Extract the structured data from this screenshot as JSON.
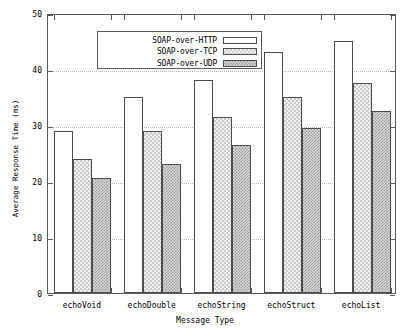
{
  "chart_data": {
    "type": "bar",
    "title": "",
    "xlabel": "Message Type",
    "ylabel": "Average Response Time (ms)",
    "ylim": [
      0,
      50
    ],
    "yticks": [
      0,
      10,
      20,
      30,
      40,
      50
    ],
    "grid": true,
    "legend_position": "top-left",
    "categories": [
      "echoVoid",
      "echoDouble",
      "echoString",
      "echoStruct",
      "echoList"
    ],
    "series": [
      {
        "name": "SOAP-over-HTTP",
        "values": [
          29,
          35,
          38,
          43,
          45
        ]
      },
      {
        "name": "SOAP-over-TCP",
        "values": [
          24,
          29,
          31.5,
          35,
          37.5
        ]
      },
      {
        "name": "SOAP-over-UDP",
        "values": [
          20.5,
          23,
          26.5,
          29.5,
          32.5
        ]
      }
    ]
  },
  "axes": {
    "ytick_labels": [
      "0",
      "10",
      "20",
      "30",
      "40",
      "50"
    ],
    "y_title": "Average Response Time (ms)",
    "x_title": "Message Type",
    "x_tick_labels": [
      "echoVoid",
      "echoDouble",
      "echoString",
      "echoStruct",
      "echoList"
    ]
  },
  "legend": {
    "entries": [
      {
        "label": "SOAP-over-HTTP",
        "pattern": "solid-white"
      },
      {
        "label": "SOAP-over-TCP",
        "pattern": "light-checker"
      },
      {
        "label": "SOAP-over-UDP",
        "pattern": "dark-checker"
      }
    ]
  },
  "colors": {
    "frame": "#5a5a5a",
    "grid": "#b9b9b9",
    "bar_border": "#4d4d4d",
    "series1_fill": "#ffffff",
    "series2_fill": "#f2f2f2",
    "series3_fill": "#d8d8d8",
    "background": "#ffffff"
  }
}
